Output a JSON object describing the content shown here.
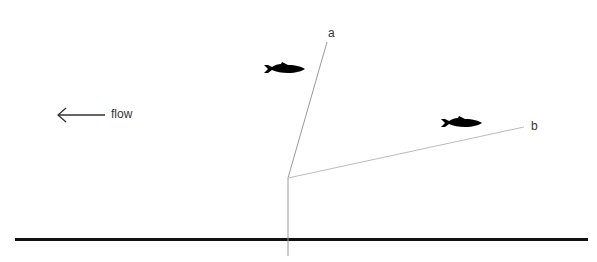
{
  "labels": {
    "a": "a",
    "b": "b",
    "flow": "flow"
  },
  "elements": {
    "flow_arrow": "left-arrow",
    "fish_1": "fish-silhouette",
    "fish_2": "fish-silhouette",
    "ground_line": "riverbed",
    "vertical_line": "post",
    "line_a": "line-a",
    "line_b": "line-b"
  },
  "colors": {
    "ground": "#111111",
    "thin_lines": "#999999",
    "fish": "#000000",
    "text": "#333333"
  }
}
